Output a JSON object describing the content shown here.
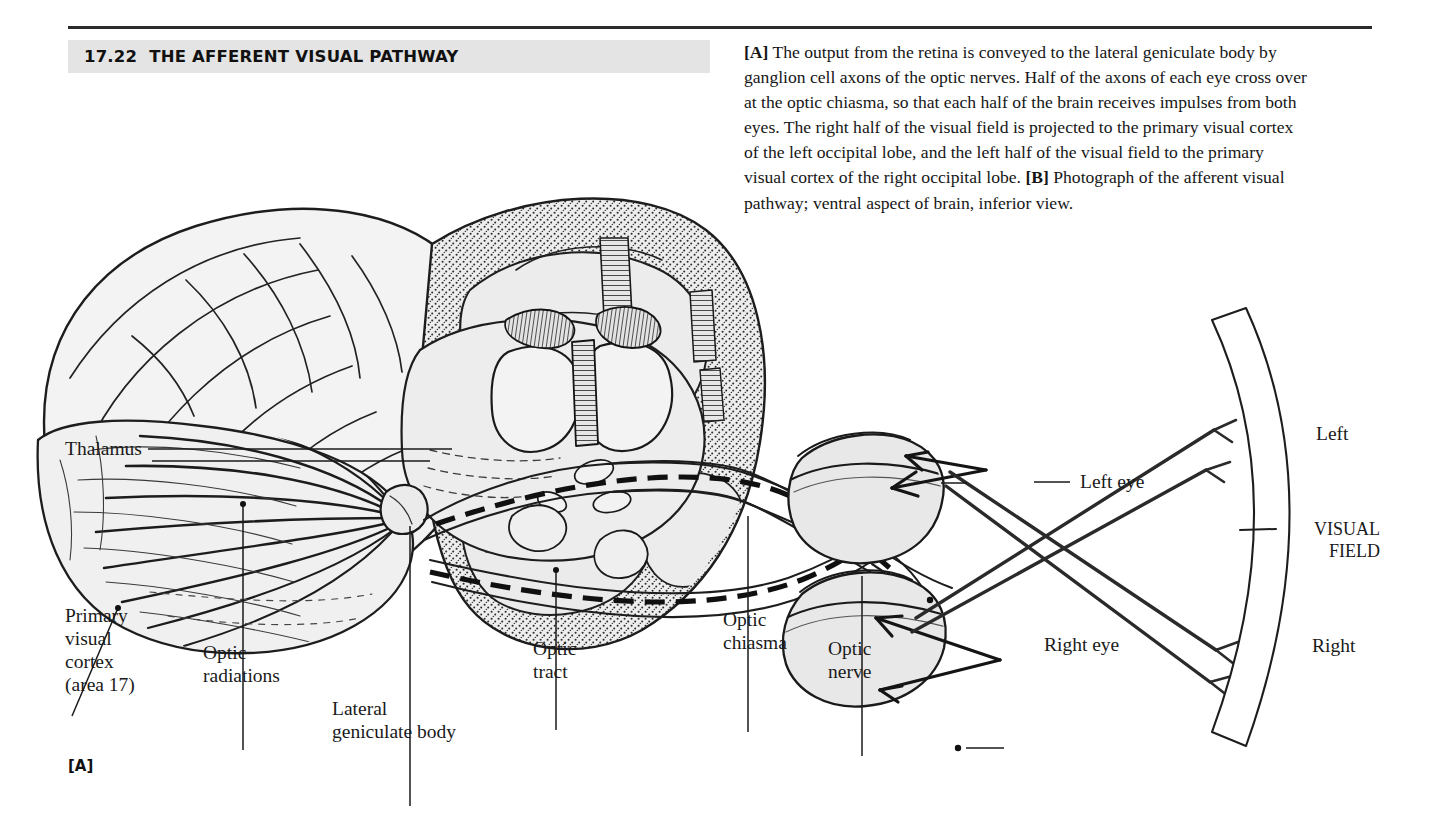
{
  "figure": {
    "number": "17.22",
    "title": "THE AFFERENT VISUAL PATHWAY",
    "panel_letter": "[A]"
  },
  "caption": {
    "part_a_tag": "[A]",
    "part_a_text": " The output from the retina is conveyed to the lateral geniculate body by ganglion cell axons of the optic nerves. Half of the axons of each eye cross over at the optic chiasma, so that each half of the brain receives impulses from both eyes. The right half of the visual field is projected to the primary visual cortex of the left occipital lobe, and the left half of the visual field to the primary visual cortex of the right occipital lobe. ",
    "part_b_tag": "[B]",
    "part_b_text": " Photograph of the afferent visual pathway; ventral aspect of brain, inferior view."
  },
  "labels": {
    "thalamus": "Thalamus",
    "primary_visual_cortex": "Primary\nvisual\ncortex\n(area 17)",
    "optic_radiations": "Optic\nradiations",
    "lateral_geniculate_body": "Lateral\ngeniculate body",
    "optic_tract": "Optic\ntract",
    "optic_chiasma": "Optic\nchiasma",
    "optic_nerve": "Optic\nnerve",
    "left_eye": "Left eye",
    "right_eye": "Right eye",
    "field_left": "Left",
    "field_title": "VISUAL\nFIELD",
    "field_right": "Right"
  },
  "colors": {
    "ink": "#1a1a1a",
    "rule": "#2b2b2b",
    "title_band": "#e4e4e4",
    "tissue_fill": "#e9e9e9",
    "tissue_fill_light": "#f2f2f2",
    "stipple": "#3a3a3a",
    "page": "#ffffff"
  }
}
